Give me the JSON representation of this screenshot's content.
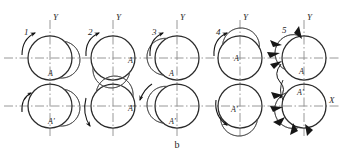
{
  "figure": {
    "caption": "b",
    "axis_labels": {
      "y": "Y",
      "x": "X"
    },
    "colors": {
      "stroke": "#2b2b2b",
      "axis": "#8c8c8c",
      "arc_fill": "#9b9b9b",
      "arc_stroke": "#4a4a4a",
      "arrow": "#161616",
      "background": "#ffffff"
    },
    "geometry": {
      "circle_radius": 22,
      "row_top_cy": 58,
      "row_bottom_cy": 106,
      "column_cx": [
        50,
        113,
        177,
        240,
        304
      ]
    },
    "groups": [
      {
        "number": "1",
        "cx": 50,
        "upper": {
          "label": "A",
          "label_x": 51,
          "label_y": 76,
          "arc_start_deg": -50,
          "arc_end_deg": 55
        },
        "lower": {
          "label": "A'",
          "label_x": 51,
          "label_y": 124,
          "arc_start_deg": -50,
          "arc_end_deg": 55
        },
        "rotation_arrow": "ccw-upper-left",
        "has_force_arrows": false
      },
      {
        "number": "2",
        "cx": 113,
        "upper": {
          "label": "A",
          "label_x": 130,
          "label_y": 63,
          "arc_start_deg": 40,
          "arc_end_deg": 140
        },
        "lower": {
          "label": "A'",
          "label_x": 130,
          "label_y": 110,
          "arc_start_deg": -140,
          "arc_end_deg": -40
        },
        "rotation_arrow": "ccw-upper-left",
        "has_force_arrows": false
      },
      {
        "number": "3",
        "cx": 177,
        "upper": {
          "label": "A",
          "label_x": 171,
          "label_y": 74,
          "arc_start_deg": 130,
          "arc_end_deg": 230
        },
        "lower": {
          "label": "A'",
          "label_x": 171,
          "label_y": 124,
          "arc_start_deg": 130,
          "arc_end_deg": 230
        },
        "rotation_arrow": "ccw-upper-left",
        "has_force_arrows": false
      },
      {
        "number": "4",
        "cx": 240,
        "upper": {
          "label": "A",
          "label_x": 238,
          "label_y": 58,
          "arc_start_deg": -145,
          "arc_end_deg": -40
        },
        "lower": {
          "label": "A'",
          "label_x": 236,
          "label_y": 106,
          "arc_start_deg": 40,
          "arc_end_deg": 145
        },
        "rotation_arrow": "ccw-upper-left",
        "has_force_arrows": false
      },
      {
        "number": "5",
        "cx": 304,
        "upper": {
          "label": "A",
          "label_x": 301,
          "label_y": 72,
          "arc_start_deg": 150,
          "arc_end_deg": 255
        },
        "lower": {
          "label": "A'",
          "label_x": 301,
          "label_y": 95,
          "arc_start_deg": 105,
          "arc_end_deg": 210
        },
        "rotation_arrow": "s-curve-left",
        "has_force_arrows": true
      }
    ]
  }
}
